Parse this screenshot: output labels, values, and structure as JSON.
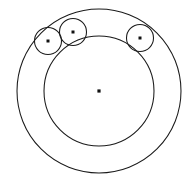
{
  "figure": {
    "title": "Three congruent circles inscribed in a circular annulus",
    "background_color": "#ffffff",
    "stroke_color": "#1a1a1a",
    "dot_color": "#111111",
    "stroke_width": 1.05,
    "canvas": {
      "width": 196,
      "height": 181
    }
  },
  "geometry": {
    "common_center": {
      "label": "O",
      "cx": 99,
      "cy": 91,
      "dot_radius": 1.6
    },
    "outer_circle": {
      "label": "outer boundary circle",
      "cx": 99,
      "cy": 91,
      "r": 82
    },
    "inner_circle": {
      "label": "inner boundary circle",
      "cx": 99,
      "cy": 91,
      "r": 55
    },
    "annulus_width": 27,
    "small_circle_radius": 13.5,
    "small_circles": [
      {
        "label": "left small circle",
        "cx": 48,
        "cy": 41,
        "r": 13.5,
        "dot_radius": 1.5,
        "angle_deg": 135
      },
      {
        "label": "top small circle",
        "cx": 73,
        "cy": 32,
        "r": 13.5,
        "dot_radius": 1.5,
        "angle_deg": 113
      },
      {
        "label": "right small circle",
        "cx": 140,
        "cy": 38,
        "r": 13.5,
        "dot_radius": 1.5,
        "angle_deg": 52
      }
    ]
  }
}
